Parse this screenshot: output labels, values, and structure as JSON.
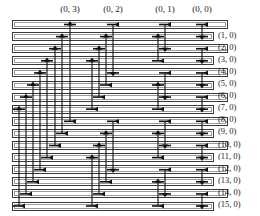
{
  "figure": {
    "kind": "butterfly-permutation-network",
    "background_color": "#ffffff",
    "line_color": "#111111",
    "bar_border_color": "#3a3a3a",
    "bar_fill_color": "#ffffff"
  },
  "column_headers": [
    {
      "label": "(0, 3)",
      "x": 70,
      "stage": 3
    },
    {
      "label": "(0, 2)",
      "x": 113,
      "stage": 2
    },
    {
      "label": "(0, 1)",
      "x": 165,
      "stage": 1
    },
    {
      "label": "(0, 0)",
      "x": 202,
      "stage": 0
    }
  ],
  "row_labels": [
    "(1, 0)",
    "(2, 0)",
    "(3, 0)",
    "(4, 0)",
    "(5, 0)",
    "(6, 0)",
    "(7, 0)",
    "(8, 0)",
    "(9, 0)",
    "(10, 0)",
    "(11, 0)",
    "(12, 0)",
    "(13, 0)",
    "(14, 0)",
    "(15, 0)"
  ],
  "rows": {
    "count": 16,
    "first_row_top": 20,
    "row_pitch": 12.1,
    "bar_height": 9,
    "bar_left": 12,
    "long_bar_right": 228,
    "short_bar_right": 214
  },
  "bar_lengths": [
    "long",
    "short",
    "long",
    "short",
    "long",
    "short",
    "long",
    "short",
    "long",
    "short",
    "long",
    "short",
    "long",
    "short",
    "long",
    "short"
  ],
  "chart_data": {
    "type": "diagram",
    "title": "",
    "stages": [
      {
        "name": "(0, 3)",
        "x": 70,
        "span": 8,
        "links": [
          {
            "from_row": 0,
            "to_row": 8,
            "x": 70,
            "dir": "up"
          },
          {
            "from_row": 1,
            "to_row": 9,
            "x": 62,
            "dir": "up"
          },
          {
            "from_row": 2,
            "to_row": 10,
            "x": 55,
            "dir": "up"
          },
          {
            "from_row": 3,
            "to_row": 11,
            "x": 47,
            "dir": "up"
          },
          {
            "from_row": 4,
            "to_row": 12,
            "x": 40,
            "dir": "up"
          },
          {
            "from_row": 5,
            "to_row": 13,
            "x": 33,
            "dir": "up"
          },
          {
            "from_row": 6,
            "to_row": 14,
            "x": 26,
            "dir": "up"
          },
          {
            "from_row": 7,
            "to_row": 15,
            "x": 19,
            "dir": "up"
          }
        ]
      },
      {
        "name": "(0, 2)",
        "x": 113,
        "span": 4,
        "links": [
          {
            "from_row": 0,
            "to_row": 4,
            "x": 113,
            "dir": "down"
          },
          {
            "from_row": 1,
            "to_row": 5,
            "x": 106,
            "dir": "up"
          },
          {
            "from_row": 2,
            "to_row": 6,
            "x": 99,
            "dir": "up"
          },
          {
            "from_row": 3,
            "to_row": 7,
            "x": 92,
            "dir": "up"
          },
          {
            "from_row": 8,
            "to_row": 12,
            "x": 113,
            "dir": "down"
          },
          {
            "from_row": 9,
            "to_row": 13,
            "x": 106,
            "dir": "up"
          },
          {
            "from_row": 10,
            "to_row": 14,
            "x": 99,
            "dir": "up"
          },
          {
            "from_row": 11,
            "to_row": 15,
            "x": 92,
            "dir": "up"
          }
        ]
      },
      {
        "name": "(0, 1)",
        "x": 165,
        "span": 2,
        "links": [
          {
            "from_row": 0,
            "to_row": 2,
            "x": 165,
            "dir": "down"
          },
          {
            "from_row": 1,
            "to_row": 3,
            "x": 158,
            "dir": "up"
          },
          {
            "from_row": 4,
            "to_row": 6,
            "x": 165,
            "dir": "down"
          },
          {
            "from_row": 5,
            "to_row": 7,
            "x": 158,
            "dir": "up"
          },
          {
            "from_row": 8,
            "to_row": 10,
            "x": 165,
            "dir": "down"
          },
          {
            "from_row": 9,
            "to_row": 11,
            "x": 158,
            "dir": "up"
          },
          {
            "from_row": 12,
            "to_row": 14,
            "x": 165,
            "dir": "down"
          },
          {
            "from_row": 13,
            "to_row": 15,
            "x": 158,
            "dir": "up"
          }
        ]
      },
      {
        "name": "(0, 0)",
        "x": 202,
        "span": 1,
        "links": [
          {
            "from_row": 0,
            "to_row": 1,
            "x": 202,
            "dir": "down"
          },
          {
            "from_row": 2,
            "to_row": 3,
            "x": 202,
            "dir": "down"
          },
          {
            "from_row": 4,
            "to_row": 5,
            "x": 202,
            "dir": "down"
          },
          {
            "from_row": 6,
            "to_row": 7,
            "x": 202,
            "dir": "down"
          },
          {
            "from_row": 8,
            "to_row": 9,
            "x": 202,
            "dir": "down"
          },
          {
            "from_row": 10,
            "to_row": 11,
            "x": 202,
            "dir": "down"
          },
          {
            "from_row": 12,
            "to_row": 13,
            "x": 202,
            "dir": "down"
          },
          {
            "from_row": 14,
            "to_row": 15,
            "x": 202,
            "dir": "down"
          }
        ]
      }
    ]
  }
}
